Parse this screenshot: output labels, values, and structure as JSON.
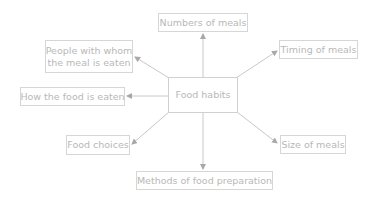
{
  "diagram": {
    "type": "mind-map",
    "center": {
      "label": "Food habits"
    },
    "nodes": [
      {
        "id": "numbers",
        "label": "Numbers of meals"
      },
      {
        "id": "timing",
        "label": "Timing of meals"
      },
      {
        "id": "people",
        "label": "People with whom the meal is eaten",
        "line1": "People with whom",
        "line2": "the meal is eaten"
      },
      {
        "id": "how",
        "label": "How the food is eaten"
      },
      {
        "id": "choices",
        "label": "Food choices"
      },
      {
        "id": "size",
        "label": "Size of meals"
      },
      {
        "id": "methods",
        "label": "Methods of food preparation"
      }
    ],
    "edges": [
      {
        "from": "center",
        "to": "numbers"
      },
      {
        "from": "center",
        "to": "timing"
      },
      {
        "from": "center",
        "to": "people"
      },
      {
        "from": "center",
        "to": "how"
      },
      {
        "from": "center",
        "to": "choices"
      },
      {
        "from": "center",
        "to": "size"
      },
      {
        "from": "center",
        "to": "methods"
      }
    ],
    "colors": {
      "border": "#d6d6d6",
      "text": "#b8b8b8",
      "edge": "#c8c8c8",
      "arrow": "#a8a8a8"
    }
  }
}
